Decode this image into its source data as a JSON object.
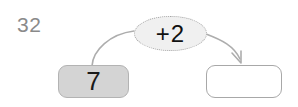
{
  "exercise": {
    "number": "32"
  },
  "diagram": {
    "type": "function-machine",
    "input_node": {
      "value": "7",
      "fill_color": "#d4d4d4",
      "border_color": "#b3b3b3"
    },
    "operation_node": {
      "label": "+2",
      "operator": "+",
      "operand": "2",
      "fill_color": "#f0f0f0",
      "border_color": "#a5a5a5",
      "border_style": "dotted"
    },
    "output_node": {
      "value": "",
      "fill_color": "#ffffff",
      "border_color": "#a8a8a8"
    },
    "connectors": [
      {
        "name": "input-to-operation",
        "from": "input_node",
        "to": "operation_node",
        "has_arrowhead": false,
        "color": "#adadad"
      },
      {
        "name": "operation-to-output",
        "from": "operation_node",
        "to": "output_node",
        "has_arrowhead": true,
        "color": "#adadad"
      }
    ]
  }
}
